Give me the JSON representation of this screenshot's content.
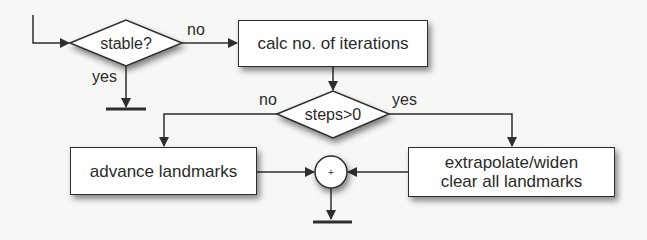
{
  "diagram": {
    "type": "flowchart",
    "nodes": {
      "decision_stable": {
        "label": "stable?",
        "shape": "diamond"
      },
      "calc_iterations": {
        "label": "calc no. of iterations",
        "shape": "rect"
      },
      "decision_steps": {
        "label": "steps>0",
        "shape": "diamond"
      },
      "advance_landmarks": {
        "label": "advance landmarks",
        "shape": "rect"
      },
      "extrapolate": {
        "label_line1": "extrapolate/widen",
        "label_line2": "clear all landmarks",
        "shape": "rect"
      },
      "merge": {
        "label": "+",
        "shape": "circle"
      }
    },
    "edges": {
      "stable_no": "no",
      "stable_yes": "yes",
      "steps_no": "no",
      "steps_yes": "yes"
    },
    "colors": {
      "line": "#2e2e2e",
      "fill": "#ffffff",
      "background": "#f7f7f5"
    }
  }
}
